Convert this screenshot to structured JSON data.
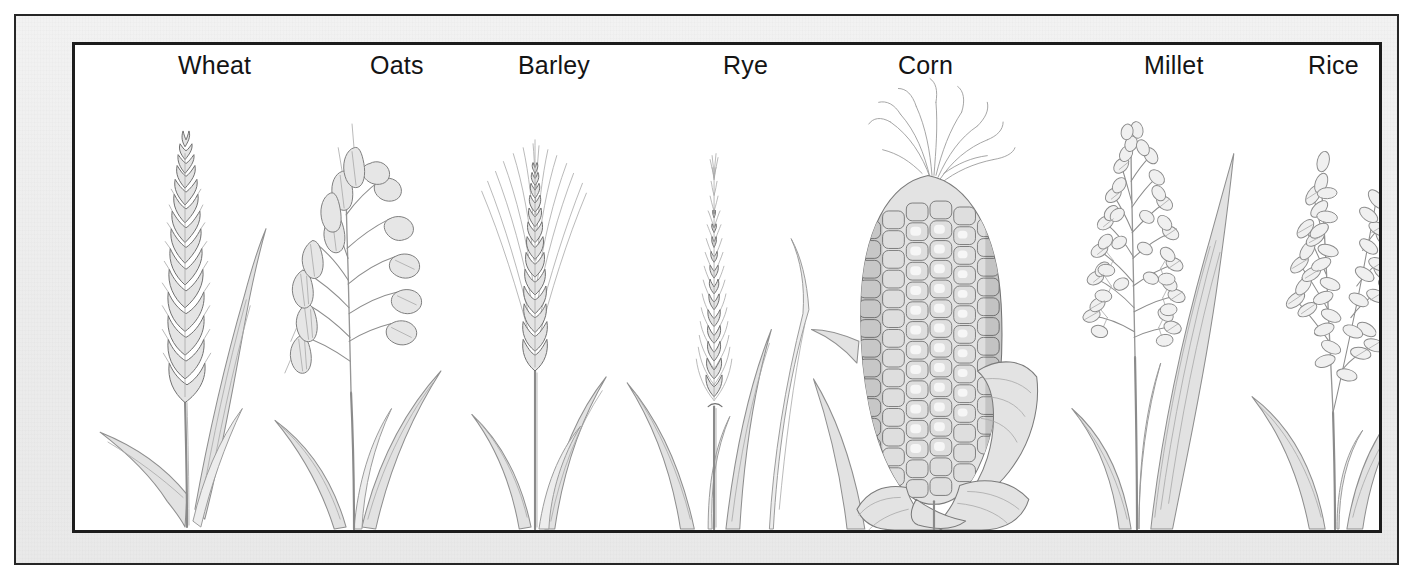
{
  "plate": {
    "title": "Cereal Grains",
    "frame": {
      "mat_color": "#efefef",
      "border_color": "#1c1c1c",
      "field_color": "#ffffff",
      "paper_color": "#ffffff"
    },
    "medium": "graphite pencil illustration",
    "ink_color": "#8d8d8d",
    "label_color": "#141414"
  },
  "specimens": [
    {
      "id": "wheat",
      "label": "Wheat",
      "icon": "wheat-spike-icon",
      "label_left": 103,
      "panel_left": 20,
      "panel_width": 185,
      "form": "dense spike of overlapping spikelets with upright stem and long curving blade leaves"
    },
    {
      "id": "oats",
      "label": "Oats",
      "icon": "oat-panicle-icon",
      "label_left": 295,
      "panel_left": 175,
      "panel_width": 210,
      "form": "open panicle with pendulous teardrop spikelets on slender branching stalks"
    },
    {
      "id": "barley",
      "label": "Barley",
      "icon": "barley-spike-icon",
      "label_left": 443,
      "panel_left": 370,
      "panel_width": 185,
      "form": "spike with long radiating awns spreading upward"
    },
    {
      "id": "rye",
      "label": "Rye",
      "icon": "rye-spike-icon",
      "label_left": 648,
      "panel_left": 545,
      "panel_width": 200,
      "form": "slender tapering spike with fine short awns"
    },
    {
      "id": "corn",
      "label": "Corn",
      "icon": "corn-ear-icon",
      "label_left": 823,
      "panel_left": 735,
      "panel_width": 245,
      "form": "ear with grid of kernels, silk tassels at the tip and peeled-back husk leaves"
    },
    {
      "id": "millet",
      "label": "Millet",
      "icon": "millet-panicle-icon",
      "label_left": 1069,
      "panel_left": 960,
      "panel_width": 205,
      "form": "dense branching panicle of small oval seeds with a broad blade leaf"
    },
    {
      "id": "rice",
      "label": "Rice",
      "icon": "rice-panicle-icon",
      "label_left": 1233,
      "panel_left": 1160,
      "panel_width": 205,
      "form": "drooping panicle of elongated pointed grains on arching branches"
    }
  ]
}
